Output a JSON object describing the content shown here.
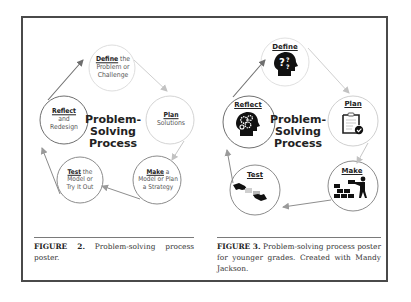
{
  "figure2": {
    "center_title": [
      "Problem-",
      "Solving",
      "Process"
    ],
    "stages": [
      {
        "id": "define",
        "verb": "Define",
        "rest_line1": " the",
        "lines": [
          "Problem or",
          "Challenge"
        ]
      },
      {
        "id": "plan",
        "verb": "Plan",
        "rest_line1": "",
        "lines": [
          "Solutions"
        ]
      },
      {
        "id": "make",
        "verb": "Make",
        "rest_line1": " a",
        "lines": [
          "Model or Plan",
          "a Strategy"
        ]
      },
      {
        "id": "test",
        "verb": "Test",
        "rest_line1": " the",
        "lines": [
          "Model or",
          "Try It Out"
        ]
      },
      {
        "id": "reflect",
        "verb": "Reflect",
        "rest_line1": "",
        "lines": [
          "and",
          "Redesign"
        ]
      }
    ],
    "caption": {
      "label": "FIGURE 2.",
      "text": " Problem-solving process poster."
    }
  },
  "figure3": {
    "center_title": [
      "Problem-",
      "Solving",
      "Process"
    ],
    "stages": [
      {
        "id": "define",
        "label": "Define",
        "icon": "head-question-icon"
      },
      {
        "id": "plan",
        "label": "Plan",
        "icon": "clipboard-check-icon"
      },
      {
        "id": "make",
        "label": "Make",
        "icon": "worker-bricks-icon"
      },
      {
        "id": "test",
        "label": "Test",
        "icon": "hands-puzzle-icon"
      },
      {
        "id": "reflect",
        "label": "Reflect",
        "icon": "head-gears-icon"
      }
    ],
    "caption": {
      "label": "FIGURE 3.",
      "text": " Problem-solving process poster for younger grades. Created with Mandy Jackson."
    }
  },
  "colors": {
    "frame": "#4a4a4a",
    "circle_stroke": "#8a8a8a",
    "circle_stroke_light": "#d0d0d0",
    "arrow_dark": "#707070",
    "arrow_light": "#c4c4c4",
    "text": "#222222"
  }
}
